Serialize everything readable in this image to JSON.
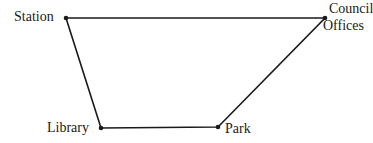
{
  "diagram": {
    "type": "route-map",
    "nodes": [
      {
        "id": "station",
        "label": "Station",
        "x": 66,
        "y": 18
      },
      {
        "id": "council",
        "label_line1": "Council",
        "label_line2": "Offices",
        "x": 325,
        "y": 18
      },
      {
        "id": "library",
        "label": "Library",
        "x": 101,
        "y": 128
      },
      {
        "id": "park",
        "label": "Park",
        "x": 218,
        "y": 127
      }
    ],
    "edges": [
      [
        "station",
        "council"
      ],
      [
        "council",
        "park"
      ],
      [
        "park",
        "library"
      ],
      [
        "library",
        "station"
      ]
    ],
    "line_color": "#1a1a1a"
  }
}
